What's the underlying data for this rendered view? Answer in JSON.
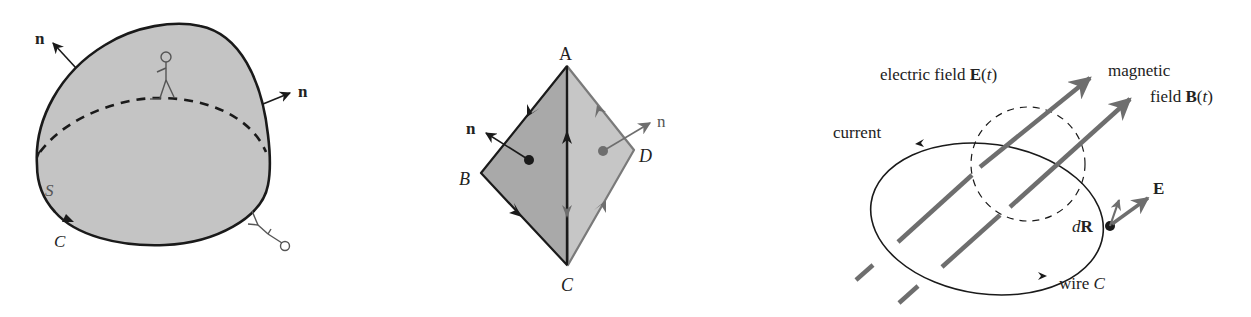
{
  "figure": {
    "panels": [
      {
        "id": "surface",
        "description": "Closed surface S bounded by curve C with outward normals and observer figures",
        "labels": {
          "normal_top_left": "n",
          "normal_right": "n",
          "surface": "S",
          "curve": "C"
        }
      },
      {
        "id": "tetrahedron",
        "description": "Two triangular faces ABC and ACD sharing edge AC with normals and edge orientations",
        "labels": {
          "vertex_a": "A",
          "vertex_b": "B",
          "vertex_c": "C",
          "vertex_d": "D",
          "normal_left": "n",
          "normal_right": "n"
        }
      },
      {
        "id": "faraday",
        "description": "Wire loop C in changing magnetic field B(t) with induced electric field E(t)",
        "labels": {
          "electric_field": "electric field ",
          "electric_field_symbol": "E",
          "electric_field_arg_open": "(",
          "electric_field_arg": "t",
          "electric_field_arg_close": ")",
          "magnetic_line1": "magnetic",
          "magnetic_line2": "field ",
          "magnetic_symbol": "B",
          "magnetic_arg_open": "(",
          "magnetic_arg": "t",
          "magnetic_arg_close": ")",
          "current": "current",
          "e_vector": "E",
          "dr_d": "d",
          "dr_r": "R",
          "wire": "wire ",
          "wire_c": "C"
        }
      }
    ],
    "colors": {
      "fill_light": "#c4c4c4",
      "fill_dark": "#a9a9a9",
      "stroke": "#1a1a1a",
      "field_lines": "#6e6e6e",
      "gray_edge": "#7a7a7a"
    }
  }
}
